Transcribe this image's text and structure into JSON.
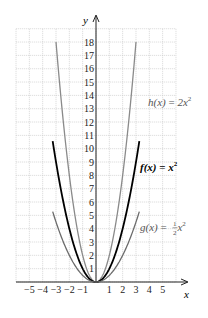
{
  "chart_data": {
    "type": "line",
    "title": "",
    "xlabel": "x",
    "ylabel": "y",
    "xlim": [
      -6,
      6
    ],
    "ylim": [
      0,
      19
    ],
    "grid": true,
    "x_ticks": [
      -5,
      -4,
      -3,
      -2,
      -1,
      1,
      2,
      3,
      4,
      5
    ],
    "x_tick_labels": [
      "−5",
      "−4",
      "−3",
      "−2",
      "−1",
      "1",
      "2",
      "3",
      "4",
      "5"
    ],
    "y_ticks": [
      1,
      2,
      3,
      4,
      5,
      6,
      7,
      8,
      9,
      10,
      11,
      12,
      13,
      14,
      15,
      16,
      17,
      18
    ],
    "y_tick_labels": [
      "1",
      "2",
      "3",
      "4",
      "5",
      "6",
      "7",
      "8",
      "9",
      "10",
      "11",
      "12",
      "13",
      "14",
      "15",
      "16",
      "17",
      "18"
    ],
    "series": [
      {
        "name": "h(x) = 2x^2",
        "label_parts": {
          "fn": "h(x)",
          "eq": " = 2x",
          "sup": "2"
        },
        "coefficient": 2,
        "x_range": [
          -3,
          3
        ],
        "color": "#8a8a8a",
        "stroke_width": 1.3,
        "label_pos": {
          "x": 148,
          "y": 106
        },
        "label_bold": false
      },
      {
        "name": "f(x) = x^2",
        "label_parts": {
          "fn": "f(x)",
          "eq": " = x",
          "sup": "2"
        },
        "coefficient": 1,
        "x_range": [
          -3.25,
          3.25
        ],
        "color": "#000000",
        "stroke_width": 1.8,
        "label_pos": {
          "x": 140,
          "y": 171
        },
        "label_bold": true
      },
      {
        "name": "g(x) = 1/2 x^2",
        "label_parts": {
          "fn": "g(x)",
          "eq": " = ",
          "frac_num": "1",
          "frac_den": "2",
          "tail": "x",
          "sup": "2"
        },
        "coefficient": 0.5,
        "x_range": [
          -3.25,
          3.25
        ],
        "color": "#6a6a6a",
        "stroke_width": 1.3,
        "label_pos": {
          "x": 140,
          "y": 231
        },
        "label_bold": false
      }
    ]
  },
  "axes": {
    "x_label": "x",
    "y_label": "y"
  }
}
